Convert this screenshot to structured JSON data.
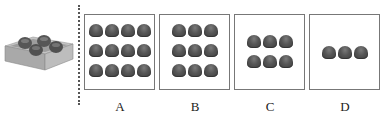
{
  "reference": {
    "description": "tray with 4 domes",
    "dome_count": 4,
    "tray_color": "#b9b9b9",
    "dome_color": "#555555"
  },
  "options": [
    {
      "label": "A",
      "rows": 3,
      "cols": 4,
      "count": 12,
      "grid_top": 9
    },
    {
      "label": "B",
      "rows": 3,
      "cols": 3,
      "count": 9,
      "grid_top": 9
    },
    {
      "label": "C",
      "rows": 2,
      "cols": 3,
      "count": 6,
      "grid_top": 20
    },
    {
      "label": "D",
      "rows": 1,
      "cols": 3,
      "count": 3,
      "grid_top": 31
    }
  ],
  "colors": {
    "border": "#777777",
    "dome": "#555555",
    "divider": "#555555",
    "label": "#222222"
  }
}
